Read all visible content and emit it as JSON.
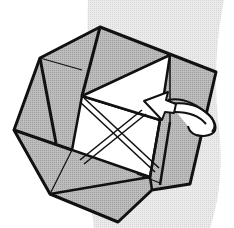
{
  "diagram": {
    "type": "origami-fold-step",
    "colors": {
      "background": "#ffffff",
      "backdrop_band": "#e3e3e3",
      "paper": "#b4b4b4",
      "paper_light": "#c2c2c2",
      "window": "#ffffff",
      "outline": "#111111"
    },
    "arrow": {
      "kind": "tuck-in",
      "direction": "counterclockwise-into-center"
    }
  }
}
